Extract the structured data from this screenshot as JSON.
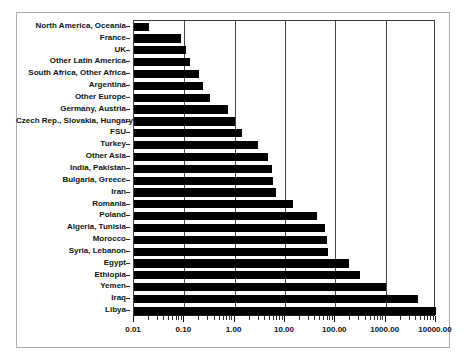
{
  "chart_data": {
    "type": "bar",
    "orientation": "horizontal",
    "title": "",
    "xlabel": "",
    "ylabel": "",
    "xscale": "log",
    "xlim": [
      0.01,
      10000
    ],
    "grid": "vertical-major-only",
    "legend": "none",
    "bar_color": "#000000",
    "xticks": [
      "0.01",
      "0.10",
      "1.00",
      "10.00",
      "100.00",
      "1000.00",
      "10000.00"
    ],
    "xtick_values": [
      0.01,
      0.1,
      1,
      10,
      100,
      1000,
      10000
    ],
    "categories": [
      "North America, Oceania",
      "France",
      "UK",
      "Other Latin America",
      "South Africa, Other Africa",
      "Argentina",
      "Other Europe",
      "Germany, Austria",
      "Czech Rep., Slovakia, Hungary",
      "FSU",
      "Turkey",
      "Other Asia",
      "India, Pakistan",
      "Bulgaria, Greece",
      "Iran",
      "Romania",
      "Poland",
      "Algeria, Tunisia",
      "Morocco",
      "Syria, Lebanon",
      "Egypt",
      "Ethiopia",
      "Yemen",
      "Iraq",
      "Libya"
    ],
    "values": [
      0.02,
      0.085,
      0.106,
      0.13,
      0.2,
      0.23,
      0.33,
      0.73,
      1.0,
      1.4,
      2.9,
      4.5,
      5.6,
      5.7,
      6.7,
      14.5,
      44,
      62,
      68,
      72,
      190,
      310,
      1000,
      4300,
      19000
    ]
  }
}
